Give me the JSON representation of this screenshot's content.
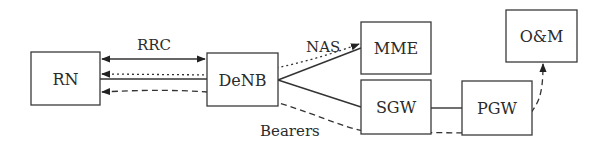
{
  "diagram": {
    "nodes": [
      {
        "id": "rn",
        "label": "RN"
      },
      {
        "id": "denb",
        "label": "DeNB"
      },
      {
        "id": "mme",
        "label": "MME"
      },
      {
        "id": "sgw",
        "label": "SGW"
      },
      {
        "id": "pgw",
        "label": "PGW"
      },
      {
        "id": "om",
        "label": "O&M"
      }
    ],
    "edge_labels": {
      "rrc": "RRC",
      "nas": "NAS",
      "bearers": "Bearers"
    },
    "edges": [
      {
        "from": "denb",
        "to": "rn",
        "style": "solid",
        "arrows": "both",
        "label": "RRC"
      },
      {
        "from": "mme",
        "to": "rn",
        "style": "dotted",
        "arrows": "both",
        "label": "NAS"
      },
      {
        "from": "rn",
        "to": "denb",
        "style": "solid",
        "arrows": "none"
      },
      {
        "from": "denb",
        "to": "mme",
        "style": "solid",
        "arrows": "none"
      },
      {
        "from": "denb",
        "to": "sgw",
        "style": "solid",
        "arrows": "none"
      },
      {
        "from": "sgw",
        "to": "pgw",
        "style": "solid",
        "arrows": "none"
      },
      {
        "from": "om",
        "to": "rn",
        "style": "dashed",
        "arrows": "both",
        "label": "Bearers"
      }
    ]
  }
}
